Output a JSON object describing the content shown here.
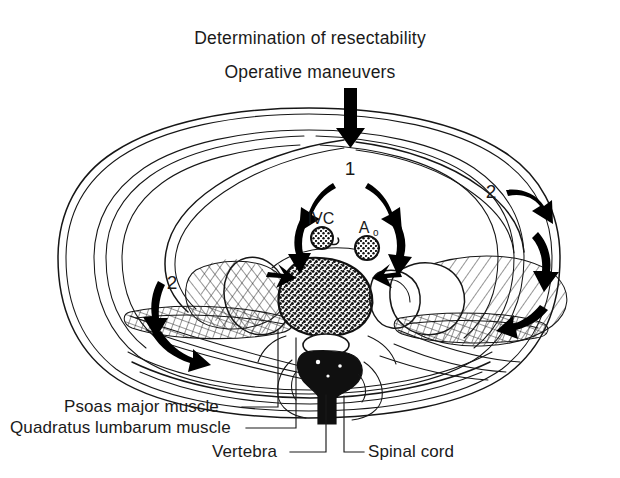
{
  "figure": {
    "kind": "anatomical-cross-section-illustration",
    "region": "axial abdominal cross-section",
    "background_color": "#ffffff",
    "ink_color": "#161616"
  },
  "title": {
    "line1": "Determination of resectability",
    "line2": "Operative maneuvers"
  },
  "steps": [
    {
      "id": "step-1",
      "number": "1",
      "x": 350,
      "y": 175
    },
    {
      "id": "step-2-right",
      "number": "2",
      "x": 491,
      "y": 198
    },
    {
      "id": "step-2-left",
      "number": "2",
      "x": 172,
      "y": 289
    }
  ],
  "vessels": [
    {
      "id": "ivc",
      "label": "IVC",
      "sub": "",
      "x": 321,
      "y": 224
    },
    {
      "id": "aorta",
      "label": "A",
      "sub": "o",
      "x": 366,
      "y": 233
    }
  ],
  "labels": [
    {
      "id": "psoas-major-muscle",
      "text": "Psoas major muscle",
      "x": 64,
      "y": 412,
      "anchor": "start"
    },
    {
      "id": "quadratus-lumbarum-muscle",
      "text": "Quadratus lumbarum muscle",
      "x": 10,
      "y": 433,
      "anchor": "start"
    },
    {
      "id": "vertebra",
      "text": "Vertebra",
      "x": 212,
      "y": 457,
      "anchor": "start"
    },
    {
      "id": "spinal-cord",
      "text": "Spinal cord",
      "x": 368,
      "y": 457,
      "anchor": "start"
    }
  ],
  "structures": {
    "vertebral_body": "stippled oval centre",
    "spinal_canal": "clear oval below vertebral body",
    "spinous_process": "dark vertical process",
    "psoas_muscles": "hatched ovals flanking vertebra",
    "quadratus_muscles": "cross-hatched flat bands lateral to psoas",
    "abdominal_wall": "multiple thin parallel contour lines"
  },
  "arrow_annotations": {
    "entry_arrow": "large vertical arrow entering from top midline",
    "diverging_pair": "two curved arrows diverging from step 1 toward IVC and aorta",
    "converging_pair": "two short arrows converging onto the vertebral body",
    "right_flank_arrows": "three curved arrows sweeping down the right flank",
    "left_flank_arrows": "two curved arrows sweeping down-left on the left flank"
  }
}
